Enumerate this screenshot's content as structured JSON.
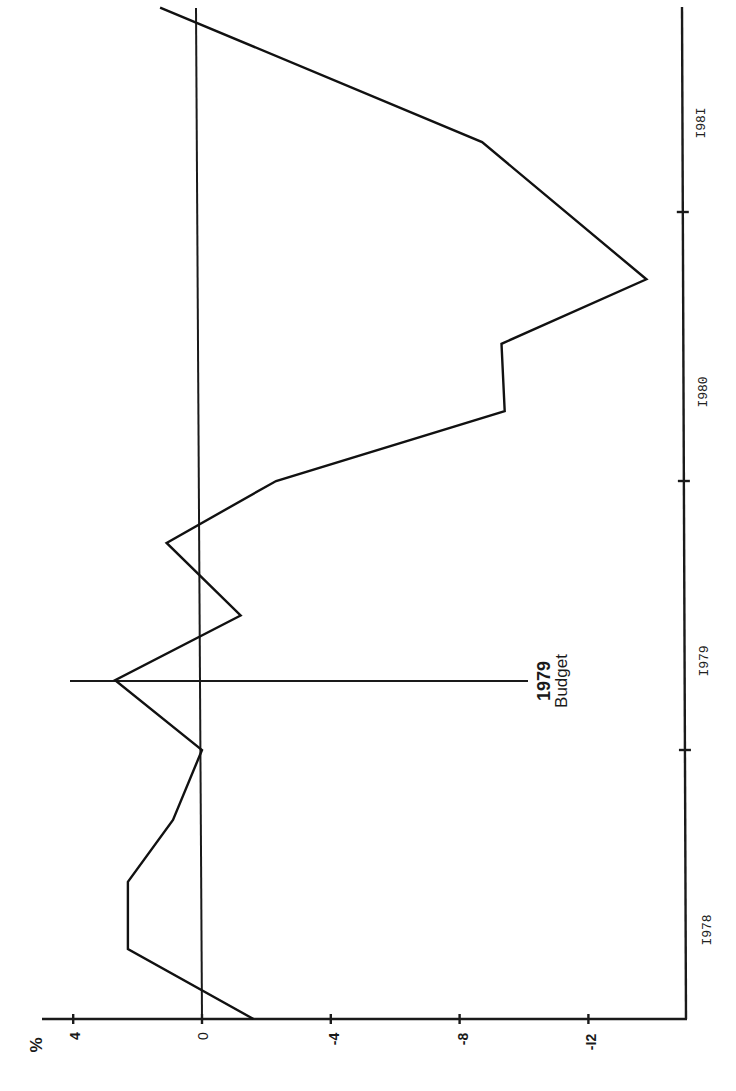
{
  "chart_data": {
    "type": "line",
    "title": "",
    "orientation_note_visual_only": "rotated 90 degrees",
    "xlabel": "",
    "ylabel": "%",
    "x_tick_labels": [
      "1978",
      "1979",
      "1980",
      "1981"
    ],
    "y_tick_labels": [
      "4",
      "0",
      "-4",
      "-8",
      "-12"
    ],
    "y_ticks": [
      4,
      0,
      -4,
      -8,
      -12
    ],
    "ylim": [
      -15,
      5
    ],
    "x": [
      "1978 Q1",
      "1978 Q2",
      "1978 Q3",
      "1978 Q4",
      "1979 Q1",
      "1979 Q2",
      "1979 Q3",
      "1979 Q4",
      "1980 Q1",
      "1980 Q2",
      "1980 Q3",
      "1980 Q4",
      "1981 Q2",
      "1981 Q4"
    ],
    "x_pos": [
      0.0,
      0.26,
      0.51,
      0.74,
      1.0,
      1.26,
      1.5,
      1.77,
      2.0,
      2.26,
      2.51,
      2.75,
      3.26,
      3.76
    ],
    "series": [
      {
        "name": "% deviation",
        "values": [
          -1.6,
          2.3,
          2.3,
          0.9,
          0.0,
          2.7,
          -1.2,
          1.1,
          -2.3,
          -9.4,
          -9.3,
          -13.8,
          -8.7,
          1.3
        ]
      }
    ],
    "annotations": [
      {
        "text": "1979 Budget",
        "line1": "1979",
        "line2": "Budget",
        "at_x_pos": 1.26
      }
    ],
    "grid": false,
    "reference_line": 0
  },
  "labels": {
    "percent": "%",
    "y_ticks": [
      "4",
      "0",
      "-4",
      "-8",
      "-I2"
    ],
    "years": [
      "I978",
      "I979",
      "I980",
      "I98I"
    ],
    "budget_line1": "1979",
    "budget_line2": "Budget"
  }
}
